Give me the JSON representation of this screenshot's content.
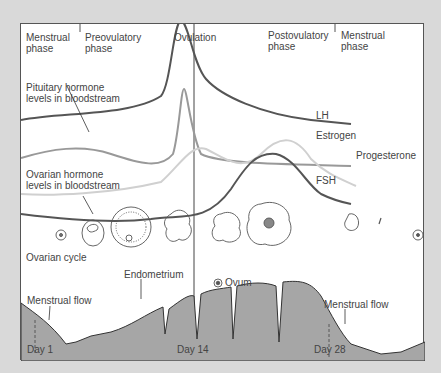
{
  "phases": {
    "menstrual_start": {
      "line1": "Menstrual",
      "line2": "phase"
    },
    "preovulatory": {
      "line1": "Preovulatory",
      "line2": "phase"
    },
    "ovulation": "Ovulation",
    "postovulatory": {
      "line1": "Postovulatory",
      "line2": "phase"
    },
    "menstrual_end": {
      "line1": "Menstrual",
      "line2": "phase"
    }
  },
  "labels": {
    "pituitary": {
      "line1": "Pituitary hormone",
      "line2": "levels in bloodstream"
    },
    "ovarian": {
      "line1": "Ovarian hormone",
      "line2": "levels in bloodstream"
    },
    "ovarian_cycle": "Ovarian cycle",
    "ovum": "Ovum",
    "endometrium": "Endometrium",
    "menstrual_flow_left": "Menstrual flow",
    "menstrual_flow_right": "Menstrual flow"
  },
  "hormones": {
    "lh": "LH",
    "estrogen": "Estrogen",
    "progesterone": "Progesterone",
    "fsh": "FSH"
  },
  "days": {
    "day1": "Day 1",
    "day14": "Day 14",
    "day28": "Day 28"
  },
  "colors": {
    "background": "#d9d9d9",
    "panel": "#ffffff",
    "lh_curve": "#555555",
    "fsh_curve": "#999999",
    "estrogen_curve": "#aaaaaa",
    "estrogen_light": "#d6d6d6",
    "progesterone_curve": "#555555",
    "endometrium_fill": "#a6a6a6"
  }
}
